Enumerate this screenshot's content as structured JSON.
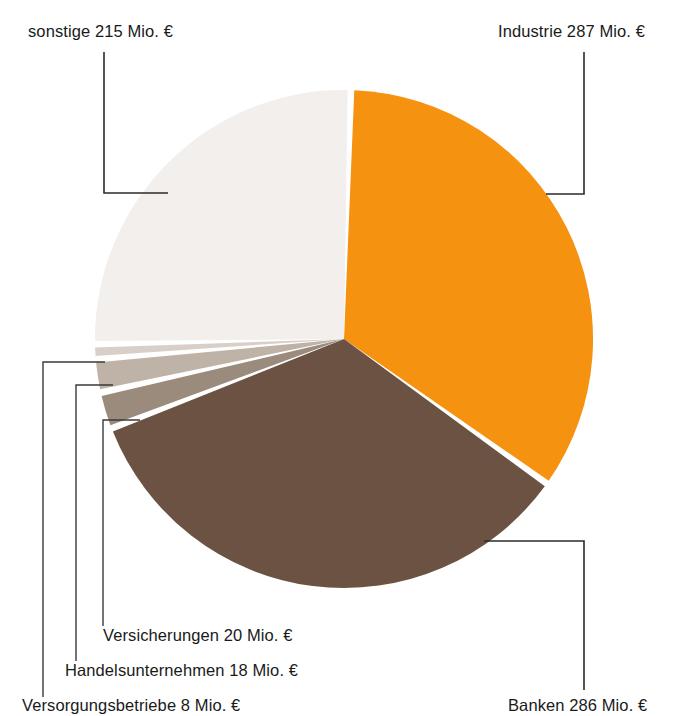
{
  "chart_data": {
    "type": "pie",
    "title": "",
    "unit": "Mio. €",
    "total": 834,
    "categories": [
      "Industrie",
      "Banken",
      "Versicherungen",
      "Handelsunternehmen",
      "Versorgungsbetriebe",
      "sonstige"
    ],
    "values": [
      287,
      286,
      20,
      18,
      8,
      215
    ],
    "labels": [
      "Industrie 287 Mio. €",
      "Banken 286 Mio. €",
      "Versicherungen 20 Mio. €",
      "Handelsunternehmen 18 Mio. €",
      "Versorgungsbetriebe 8 Mio. €",
      "sonstige 215 Mio. €"
    ],
    "colors": [
      "#f5920f",
      "#6b5243",
      "#9a8b7c",
      "#bfb3a8",
      "#d8d0c8",
      "#f2efec"
    ],
    "legend": "none",
    "grid": false,
    "data_labels": "leader-lines"
  },
  "labels": {
    "sonstige": "sonstige 215 Mio. €",
    "industrie": "Industrie 287 Mio. €",
    "versicherungen": "Versicherungen 20 Mio. €",
    "handelsunternehmen": "Handelsunternehmen 18 Mio. €",
    "versorgungsbetriebe": "Versorgungsbetriebe 8 Mio. €",
    "banken": "Banken 286 Mio. €"
  },
  "colors": {
    "industrie": "#f5920f",
    "banken": "#6b5243",
    "versicherungen": "#9a8b7c",
    "handelsunternehmen": "#bfb3a8",
    "versorgungsbetriebe": "#d8d0c8",
    "sonstige": "#f2efec",
    "background": "#ffffff",
    "leader_line": "#2b2b2b",
    "text": "#1a1a1a"
  }
}
